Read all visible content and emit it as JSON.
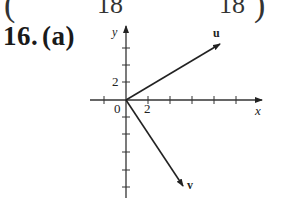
{
  "header_fragment": {
    "left_paren": "(",
    "left_denominator": "18",
    "right_denominator": "18",
    "right_paren": ")"
  },
  "problem": {
    "number": "16.",
    "part": "(a)"
  },
  "figure": {
    "x_axis_label": "x",
    "y_axis_label": "y",
    "origin_label": "0",
    "x_tick_label": "2",
    "y_tick_label": "2",
    "vector_u_label": "u",
    "vector_v_label": "v",
    "tick_spacing_units": 1,
    "u_vector": [
      6,
      3
    ],
    "v_vector": [
      3,
      -5
    ]
  }
}
